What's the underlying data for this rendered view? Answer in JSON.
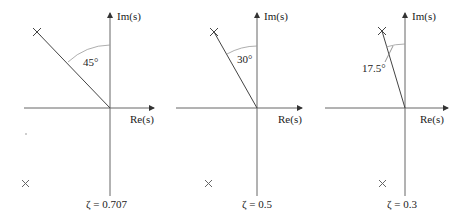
{
  "panels": [
    {
      "angle_label": "45°",
      "zeta_label": "ζ = 0.707",
      "im_label": "Im(s)",
      "re_label": "Re(s)",
      "angle_deg": 45,
      "zeta": 0.707
    },
    {
      "angle_label": "30°",
      "zeta_label": "ζ = 0.5",
      "im_label": "Im(s)",
      "re_label": "Re(s)",
      "angle_deg": 30,
      "zeta": 0.5
    },
    {
      "angle_label": "17.5°",
      "zeta_label": "ζ = 0.3",
      "im_label": "Im(s)",
      "re_label": "Re(s)",
      "angle_deg": 17.5,
      "zeta": 0.3
    }
  ],
  "colors": {
    "axis": "#555555",
    "line": "#333333",
    "arc": "#888888"
  }
}
